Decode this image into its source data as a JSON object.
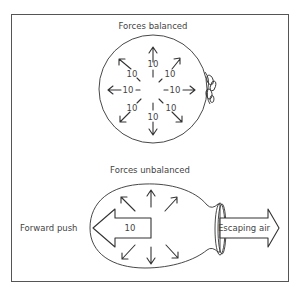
{
  "top_panel": {
    "title": "Forces balanced",
    "force_labels": [
      "10",
      "10",
      "10",
      "10",
      "10",
      "10",
      "10",
      "10"
    ]
  },
  "bottom_panel": {
    "title": "Forces unbalanced",
    "forward_push_label": "Forward push",
    "forward_push_value": "10",
    "escaping_air_label": "Escaping air"
  }
}
